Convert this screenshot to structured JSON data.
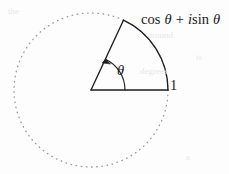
{
  "figure": {
    "type": "unit-circle-euler-diagram",
    "background_color": "#fdfdfd",
    "ink_color": "#1a1a1a",
    "dotted_circle_color": "#9a9a9a",
    "labels": {
      "point_label_cos": "cos",
      "point_label_theta1": "θ",
      "point_label_plus": "+",
      "point_label_i": "i",
      "point_label_sin": "sin",
      "point_label_theta2": "θ",
      "radius_label": "1",
      "angle_label": "θ"
    },
    "geometry": {
      "center_x": 91,
      "center_y": 90,
      "radius": 77,
      "angle_degrees": 65,
      "arc_label_radius": 34
    }
  },
  "ghost_text": [
    {
      "text": "the",
      "x": 8,
      "y": 6
    },
    {
      "text": "around",
      "x": 148,
      "y": 30
    },
    {
      "text": "is",
      "x": 196,
      "y": 52
    },
    {
      "text": "degrees",
      "x": 140,
      "y": 66
    },
    {
      "text": "a",
      "x": 186,
      "y": 152
    }
  ]
}
